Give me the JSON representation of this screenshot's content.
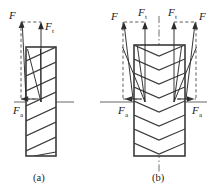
{
  "figure": {
    "title_present": false,
    "background_color": "#ffffff",
    "line_color": "#2b2b2b",
    "panels": [
      {
        "id": "a",
        "caption": "(a)",
        "gear_type": "helical-gear",
        "description": "Single helical gear tooth force diagram",
        "labels": [
          {
            "name": "force-resultant",
            "base": "F",
            "subscript": ""
          },
          {
            "name": "force-tangential",
            "base": "F",
            "subscript": "t"
          },
          {
            "name": "force-axial",
            "base": "F",
            "subscript": "a"
          }
        ]
      },
      {
        "id": "b",
        "caption": "(b)",
        "gear_type": "herringbone-gear",
        "description": "Double helical (herringbone) gear tooth force diagram",
        "labels": [
          {
            "name": "force-resultant-left",
            "base": "F",
            "subscript": ""
          },
          {
            "name": "force-tangential-left",
            "base": "F",
            "subscript": "t"
          },
          {
            "name": "force-tangential-right",
            "base": "F",
            "subscript": "t"
          },
          {
            "name": "force-resultant-right",
            "base": "F",
            "subscript": ""
          },
          {
            "name": "force-axial-left",
            "base": "F",
            "subscript": "a"
          },
          {
            "name": "force-axial-right",
            "base": "F",
            "subscript": "a"
          }
        ]
      }
    ]
  },
  "panel_a": {
    "caption": "(a)",
    "label_F": "F",
    "label_Ft_base": "F",
    "label_Ft_sub": "t",
    "label_Fa_base": "F",
    "label_Fa_sub": "a"
  },
  "panel_b": {
    "caption": "(b)",
    "label_F_left": "F",
    "label_Ft_left_base": "F",
    "label_Ft_left_sub": "t",
    "label_Ft_right_base": "F",
    "label_Ft_right_sub": "t",
    "label_F_right": "F",
    "label_Fa_left_base": "F",
    "label_Fa_left_sub": "a",
    "label_Fa_right_base": "F",
    "label_Fa_right_sub": "a"
  }
}
